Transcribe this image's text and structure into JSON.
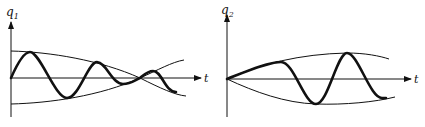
{
  "figure": {
    "color": "#111111",
    "panels": [
      {
        "name": "q1-panel",
        "y_label": "q",
        "y_label_sub": "1",
        "x_label": "t",
        "behavior": "amplitude envelopes converge, cross, then diverge; oscillation beats"
      },
      {
        "name": "q2-panel",
        "y_label": "q",
        "y_label_sub": "2",
        "x_label": "t",
        "behavior": "amplitude envelopes start at zero and grow; oscillation grows"
      }
    ]
  }
}
